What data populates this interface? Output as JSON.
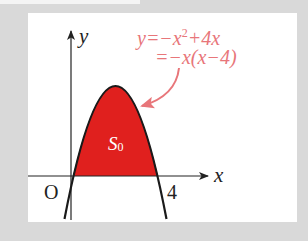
{
  "diagram": {
    "axes": {
      "x_label": "x",
      "y_label": "y",
      "origin_label": "O",
      "tick_label_4": "4"
    },
    "curve": {
      "equation_line1_prefix": "y=−x",
      "equation_line1_exp": "2",
      "equation_line1_suffix": "+4x",
      "equation_line2": "=−x(x−4)",
      "roots": [
        0,
        4
      ],
      "vertex": [
        2,
        4
      ]
    },
    "region": {
      "label_main": "S",
      "label_sub": "0",
      "fill_color": "#e0201e"
    },
    "colors": {
      "annotation": "#e8767a",
      "curve": "#1a1a1a",
      "axis": "#222222",
      "frame": "#d9d9d9",
      "panel": "#ffffff"
    }
  }
}
